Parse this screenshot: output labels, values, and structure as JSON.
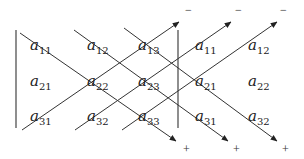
{
  "diagram": {
    "matrix": {
      "rows": [
        [
          {
            "base": "a",
            "sub": "11"
          },
          {
            "base": "a",
            "sub": "12"
          },
          {
            "base": "a",
            "sub": "13"
          }
        ],
        [
          {
            "base": "a",
            "sub": "21"
          },
          {
            "base": "a",
            "sub": "22"
          },
          {
            "base": "a",
            "sub": "23"
          }
        ],
        [
          {
            "base": "a",
            "sub": "31"
          },
          {
            "base": "a",
            "sub": "32"
          },
          {
            "base": "a",
            "sub": "33"
          }
        ]
      ],
      "repeated_columns": [
        [
          {
            "base": "a",
            "sub": "11"
          },
          {
            "base": "a",
            "sub": "12"
          }
        ],
        [
          {
            "base": "a",
            "sub": "21"
          },
          {
            "base": "a",
            "sub": "22"
          }
        ],
        [
          {
            "base": "a",
            "sub": "31"
          },
          {
            "base": "a",
            "sub": "32"
          }
        ]
      ]
    },
    "signs": {
      "top": [
        "−",
        "−",
        "−"
      ],
      "bottom": [
        "+",
        "+",
        "+"
      ]
    },
    "colors": {
      "line": "#333333",
      "text": "#222222",
      "background": "#ffffff"
    }
  }
}
